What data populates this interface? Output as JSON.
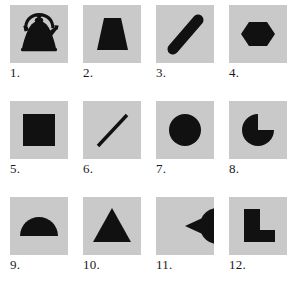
{
  "figure": {
    "background_color": "#ffffff",
    "panel_color": "#c9c9c9",
    "shape_color": "#111111",
    "columns": 4,
    "rows": 3
  },
  "items": [
    {
      "number": "1.",
      "shape_name": "kettle-silhouette",
      "description": "Black silhouette of a kettle with arched handle, lid knob and spout"
    },
    {
      "number": "2.",
      "shape_name": "trapezoid",
      "description": "Solid black isosceles trapezoid, narrow top and wide bottom"
    },
    {
      "number": "3.",
      "shape_name": "thick-diagonal-bar",
      "description": "Thick black rounded bar angled from lower-left to upper-right"
    },
    {
      "number": "4.",
      "shape_name": "hexagon",
      "description": "Solid black hexagon with pointed left and right vertices"
    },
    {
      "number": "5.",
      "shape_name": "square",
      "description": "Solid black square"
    },
    {
      "number": "6.",
      "shape_name": "thin-diagonal-line",
      "description": "Thin black line angled from lower-left to upper-right"
    },
    {
      "number": "7.",
      "shape_name": "circle",
      "description": "Solid black circle"
    },
    {
      "number": "8.",
      "shape_name": "pac-man-upper-right-notch",
      "description": "Black disc with a quarter wedge removed from the upper-right"
    },
    {
      "number": "9.",
      "shape_name": "semicircle",
      "description": "Black semicircle with the flat edge at the bottom"
    },
    {
      "number": "10.",
      "shape_name": "triangle",
      "description": "Solid black triangle pointing up"
    },
    {
      "number": "11.",
      "shape_name": "pac-man-right-notch",
      "description": "Black disc with a wedge removed facing right"
    },
    {
      "number": "12.",
      "shape_name": "l-shape",
      "description": "Solid black L-shaped polygon"
    }
  ]
}
